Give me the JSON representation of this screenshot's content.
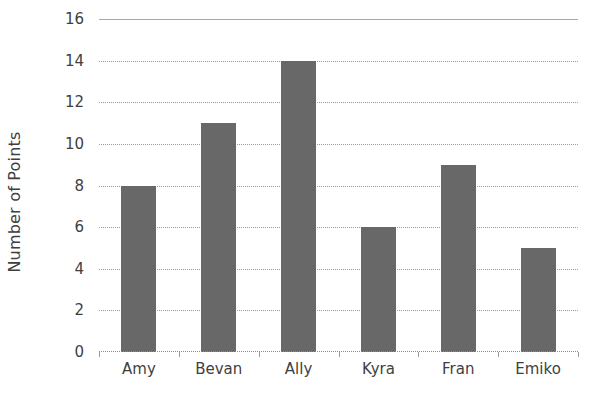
{
  "chart_data": {
    "type": "bar",
    "title": "",
    "xlabel": "",
    "ylabel": "Number of Points",
    "categories": [
      "Amy",
      "Bevan",
      "Ally",
      "Kyra",
      "Fran",
      "Emiko"
    ],
    "values": [
      8,
      11,
      14,
      6,
      9,
      5
    ],
    "ylim": [
      0,
      16
    ],
    "ytick_step": 2,
    "yticks": [
      0,
      2,
      4,
      6,
      8,
      10,
      12,
      14,
      16
    ],
    "ytick_labels": [
      "0",
      "2",
      "4",
      "6",
      "8",
      "10",
      "12",
      "14",
      "16"
    ],
    "grid": true,
    "grid_axis": "y",
    "grid_style": "dotted",
    "legend": false,
    "legend_position": "none",
    "bar_color": "#686868",
    "gridline_color": "#9a9a9a",
    "axis_color": "#a8a8a8",
    "text_color": "#3f3f3f",
    "background_color": "#ffffff"
  }
}
